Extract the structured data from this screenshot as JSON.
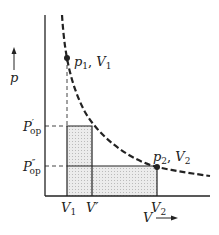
{
  "diagram": {
    "type": "p-V diagram (isotherm with two-step expansion work)",
    "axes": {
      "y_label": "p",
      "x_label": "V"
    },
    "points": {
      "p1": {
        "label": "p1, V1"
      },
      "p2": {
        "label": "p2, V2"
      }
    },
    "x_ticks": [
      "V1",
      "V'",
      "V2"
    ],
    "y_ticks": [
      "P'op",
      "P''op"
    ],
    "colors": {
      "line": "#222222",
      "shade": "#e2e2e2"
    }
  },
  "labels": {
    "p": "p",
    "V": "V",
    "p1_main": "p",
    "p1_sub": "1",
    "p1_sep": ", ",
    "V1_main": "V",
    "V1_sub": "1",
    "p2_main": "p",
    "p2_sub": "2",
    "V2_main": "V",
    "V2_sub": "2",
    "Pop1": "P",
    "Pop1_prime": "′",
    "Pop1_sub": "op",
    "Pop2": "P",
    "Pop2_prime": "″",
    "Pop2_sub": "op",
    "xV1": "V",
    "xV1_sub": "1",
    "xVp": "V′",
    "xV2": "V",
    "xV2_sub": "2"
  }
}
